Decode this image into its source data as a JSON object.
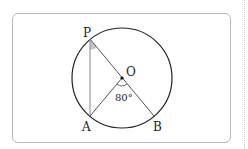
{
  "diagram": {
    "points": {
      "P": {
        "label": "P"
      },
      "O": {
        "label": "O"
      },
      "A": {
        "label": "A"
      },
      "B": {
        "label": "B"
      }
    },
    "angle_AOB": "80°",
    "colors": {
      "stroke": "#222222",
      "chord": "#999999",
      "angle_fill": "#bdbdbd"
    }
  }
}
